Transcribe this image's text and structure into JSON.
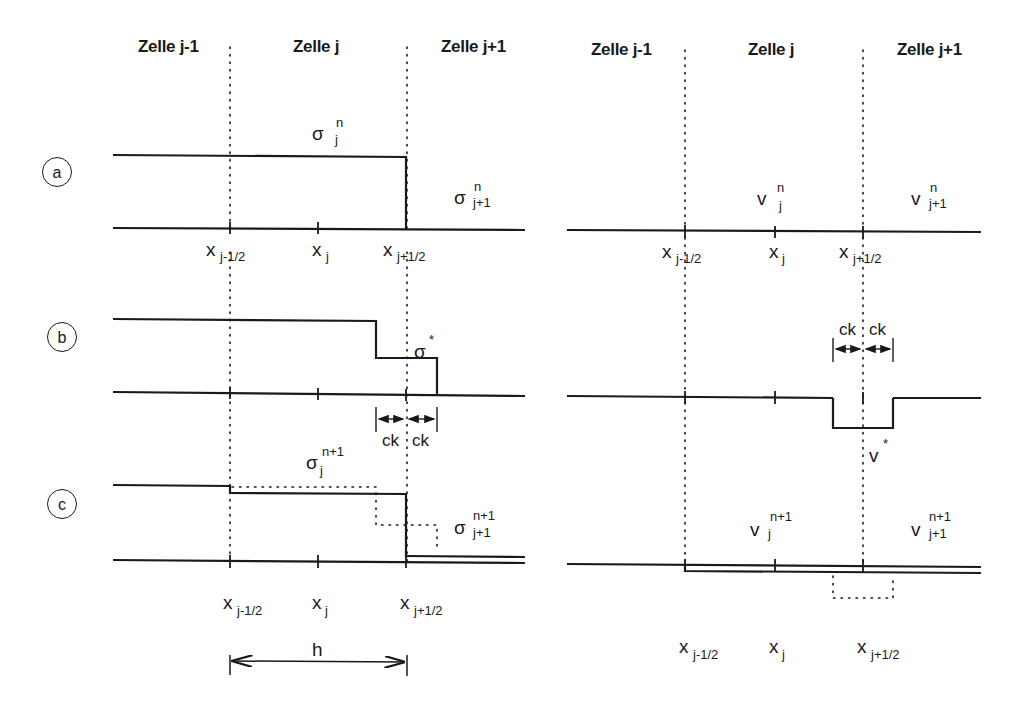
{
  "diagram": {
    "left_panel": {
      "headers": [
        "Zelle j-1",
        "Zelle j",
        "Zelle j+1"
      ],
      "quantity": "σ",
      "rows": {
        "a": {
          "label": "a",
          "left_value": {
            "sym": "σ",
            "sup": "n",
            "sub": "j"
          },
          "right_value": {
            "sym": "σ",
            "sup": "n",
            "sub": "j+1"
          }
        },
        "b": {
          "label": "b",
          "star_value": {
            "sym": "σ",
            "sup": "*"
          },
          "ck_left": "ck",
          "ck_right": "ck"
        },
        "c": {
          "label": "c",
          "left_value": {
            "sym": "σ",
            "sup": "n+1",
            "sub": "j"
          },
          "right_value": {
            "sym": "σ",
            "sup": "n+1",
            "sub": "j+1"
          }
        }
      },
      "axis_labels": [
        {
          "sym": "x",
          "sub": "j-1/2"
        },
        {
          "sym": "x",
          "sub": "j"
        },
        {
          "sym": "x",
          "sub": "j+1/2"
        }
      ],
      "width_label": "h"
    },
    "right_panel": {
      "headers": [
        "Zelle j-1",
        "Zelle j",
        "Zelle j+1"
      ],
      "quantity": "v",
      "rows": {
        "a": {
          "left_value": {
            "sym": "v",
            "sup": "n",
            "sub": "j"
          },
          "right_value": {
            "sym": "v",
            "sup": "n",
            "sub": "j+1"
          }
        },
        "b": {
          "star_value": {
            "sym": "v",
            "sup": "*"
          },
          "ck_left": "ck",
          "ck_right": "ck"
        },
        "c": {
          "left_value": {
            "sym": "v",
            "sup": "n+1",
            "sub": "j"
          },
          "right_value": {
            "sym": "v",
            "sup": "n+1",
            "sub": "j+1"
          }
        }
      },
      "axis_labels": [
        {
          "sym": "x",
          "sub": "j-1/2"
        },
        {
          "sym": "x",
          "sub": "j"
        },
        {
          "sym": "x",
          "sub": "j+1/2"
        }
      ]
    }
  }
}
